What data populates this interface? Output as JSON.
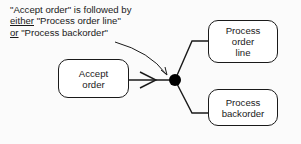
{
  "annotation": {
    "line1": "\"Accept order\" is followed by",
    "line2_underlined": "either",
    "line2_rest": " \"Process order line\"",
    "line3_underlined": "or",
    "line3_rest": " \"Process backorder\""
  },
  "nodes": {
    "accept_order": {
      "line1": "Accept",
      "line2": "order"
    },
    "process_order_line": {
      "line1": "Process",
      "line2": "order",
      "line3": "line"
    },
    "process_backorder": {
      "line1": "Process",
      "line2": "backorder"
    }
  },
  "junction": {
    "type": "exclusive-or-selection",
    "color": "#000000"
  },
  "colors": {
    "stroke": "#1a1a1a",
    "background": "#fbfbfb"
  }
}
